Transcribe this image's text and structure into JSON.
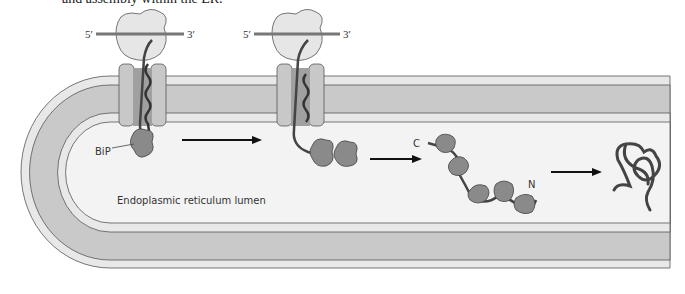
{
  "caption": {
    "text": "and assembly within the ER."
  },
  "labels": {
    "five_prime_1": "5′",
    "three_prime_1": "3′",
    "five_prime_2": "5′",
    "three_prime_2": "3′",
    "bip": "BiP",
    "lumen": "Endoplasmic reticulum lumen",
    "c_terminus": "C",
    "n_terminus": "N"
  },
  "stages": [
    {
      "name": "translocation-with-bip"
    },
    {
      "name": "continued-translocation"
    },
    {
      "name": "released-chain-with-bip"
    },
    {
      "name": "folded-protein"
    }
  ],
  "colors": {
    "membrane_outer": "#e6e6e6",
    "membrane_core": "#c8c8c8",
    "lumen": "#f2f2f2",
    "ribosome": "#e8e8e8",
    "bip": "#8a8a8a",
    "chain": "#444444"
  }
}
